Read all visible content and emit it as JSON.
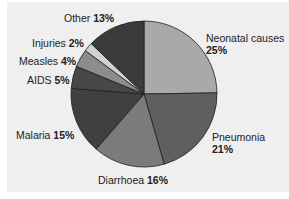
{
  "chart_data": {
    "type": "pie",
    "title": "",
    "start_angle": "12 o'clock",
    "direction": "clockwise",
    "slices": [
      {
        "label": "Neonatal causes",
        "value": 25,
        "pct": "25%",
        "color": "#a9a9a9"
      },
      {
        "label": "Pneumonia",
        "value": 21,
        "pct": "21%",
        "color": "#5f5f5f"
      },
      {
        "label": "Diarrhoea",
        "value": 16,
        "pct": "16%",
        "color": "#7b7b7b"
      },
      {
        "label": "Malaria",
        "value": 15,
        "pct": "15%",
        "color": "#404040"
      },
      {
        "label": "AIDS",
        "value": 5,
        "pct": "5%",
        "color": "#474747"
      },
      {
        "label": "Measles",
        "value": 4,
        "pct": "4%",
        "color": "#8c8c8c"
      },
      {
        "label": "Injuries",
        "value": 2,
        "pct": "2%",
        "color": "#d2d2d2"
      },
      {
        "label": "Other",
        "value": 13,
        "pct": "13%",
        "color": "#3b3b3b"
      }
    ],
    "legend": "none (direct labels)",
    "background": "#efefef"
  }
}
